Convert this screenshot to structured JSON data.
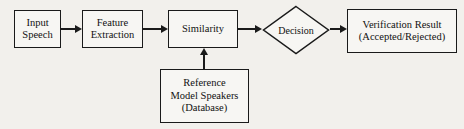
{
  "diagram": {
    "type": "flowchart",
    "background_color": "#f2f0ec",
    "stroke_color": "#1a1a1a",
    "nodes": [
      {
        "id": "input-speech",
        "shape": "rectangle",
        "lines": [
          "Input",
          "Speech"
        ]
      },
      {
        "id": "feature-extraction",
        "shape": "rectangle",
        "lines": [
          "Feature",
          "Extraction"
        ]
      },
      {
        "id": "similarity",
        "shape": "rectangle",
        "lines": [
          "Similarity"
        ]
      },
      {
        "id": "decision",
        "shape": "diamond",
        "lines": [
          "Decision"
        ]
      },
      {
        "id": "verification-result",
        "shape": "rectangle",
        "lines": [
          "Verification Result",
          "(Accepted/Rejected)"
        ]
      },
      {
        "id": "reference-database",
        "shape": "rectangle",
        "lines": [
          "Reference",
          "Model Speakers",
          "(Database)"
        ]
      }
    ],
    "edges": [
      {
        "id": "speech-to-feature",
        "from": "input-speech",
        "to": "feature-extraction",
        "direction": "right"
      },
      {
        "id": "feature-to-similarity",
        "from": "feature-extraction",
        "to": "similarity",
        "direction": "right"
      },
      {
        "id": "similarity-to-decision",
        "from": "similarity",
        "to": "decision",
        "direction": "right"
      },
      {
        "id": "decision-to-result",
        "from": "decision",
        "to": "verification-result",
        "direction": "right"
      },
      {
        "id": "database-to-similarity",
        "from": "reference-database",
        "to": "similarity",
        "direction": "up"
      }
    ]
  }
}
